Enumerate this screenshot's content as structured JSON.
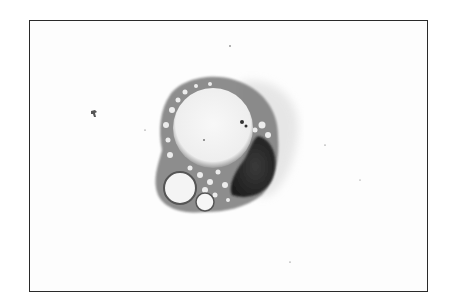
{
  "image": {
    "description": "Grayscale micrograph of a single cell with a large clear vacuole, foamy vacuolated cytoplasm, and a dark crescent-shaped nucleus",
    "background_color": "#fdfdfd",
    "border_color": "#2a2a2a",
    "cell": {
      "cytoplasm_color": "#8a8a8a",
      "nucleus_color": "#2b2b2b",
      "vacuole_color": "#f6f6f6"
    }
  }
}
